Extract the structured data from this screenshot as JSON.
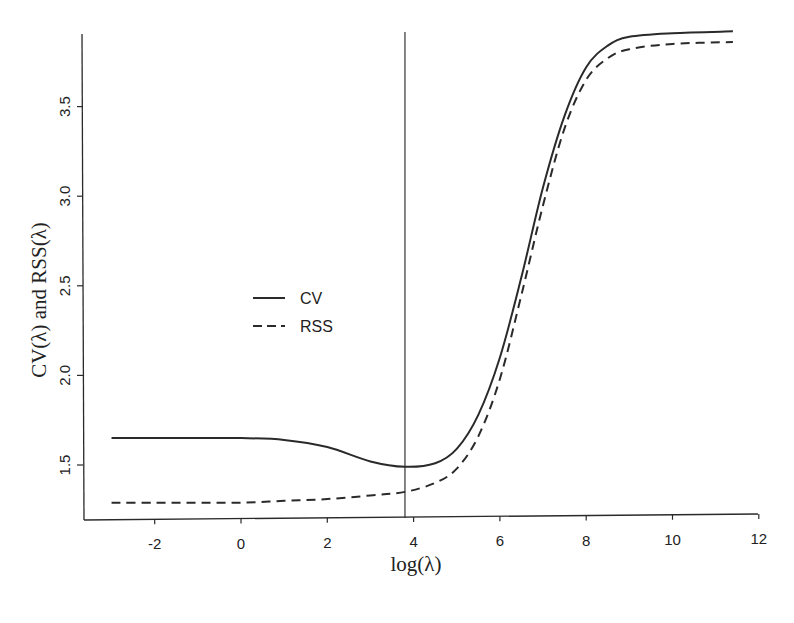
{
  "chart_data": {
    "type": "line",
    "title": "",
    "xlabel": "log(λ)",
    "ylabel": "CV(λ) and RSS(λ)",
    "xlim": [
      -3.8,
      12
    ],
    "ylim": [
      1.22,
      3.97
    ],
    "x_ticks": [
      "-2",
      "0",
      "2",
      "4",
      "6",
      "8",
      "10",
      "12"
    ],
    "y_ticks": [
      "1.5",
      "2.0",
      "2.5",
      "3.0",
      "3.5"
    ],
    "grid": false,
    "legend_position": "center-left",
    "vertical_line": {
      "x": 3.8,
      "label": ""
    },
    "series": [
      {
        "name": "CV",
        "style": "solid",
        "x": [
          -3,
          -2,
          -1,
          0,
          1,
          2,
          3,
          3.8,
          4.5,
          5,
          5.5,
          6,
          6.5,
          7,
          7.5,
          8,
          8.5,
          9,
          10,
          11.4
        ],
        "y": [
          1.65,
          1.65,
          1.65,
          1.65,
          1.64,
          1.6,
          1.52,
          1.49,
          1.51,
          1.59,
          1.78,
          2.1,
          2.55,
          3.05,
          3.45,
          3.72,
          3.84,
          3.89,
          3.91,
          3.92
        ]
      },
      {
        "name": "RSS",
        "style": "dashed",
        "x": [
          -3,
          -2,
          -1,
          0,
          1,
          2,
          3,
          3.8,
          4.5,
          5,
          5.5,
          6,
          6.5,
          7,
          7.5,
          8,
          8.5,
          9,
          10,
          11.4
        ],
        "y": [
          1.29,
          1.29,
          1.29,
          1.29,
          1.3,
          1.31,
          1.33,
          1.35,
          1.4,
          1.48,
          1.66,
          1.98,
          2.45,
          2.95,
          3.38,
          3.65,
          3.77,
          3.82,
          3.85,
          3.86
        ]
      }
    ]
  }
}
